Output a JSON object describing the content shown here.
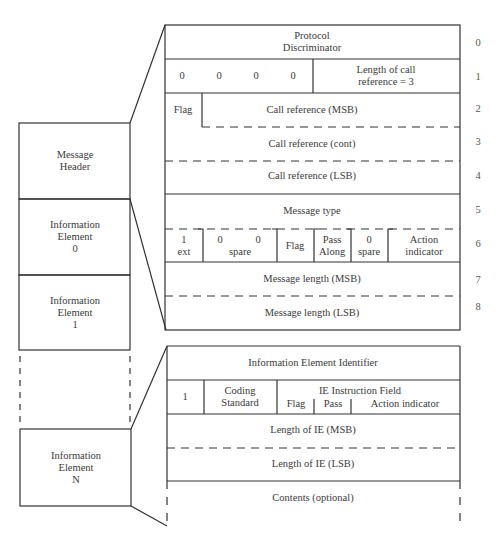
{
  "message_stack": {
    "header": "Message\nHeader",
    "ie0": "Information\nElement\n0",
    "ie1": "Information\nElement\n1",
    "ieN": "Information\nElement\nN"
  },
  "header_format": {
    "octets": [
      "0",
      "1",
      "2",
      "3",
      "4",
      "5",
      "6",
      "7",
      "8"
    ],
    "row0": "Protocol\nDiscriminator",
    "row1": {
      "bits": [
        "0",
        "0",
        "0",
        "0"
      ],
      "length": "Length of call\nreference = 3"
    },
    "row2": {
      "flag": "Flag",
      "msb": "Call reference (MSB)"
    },
    "row3": "Call reference (cont)",
    "row4": "Call reference (LSB)",
    "row5": "Message type",
    "row6": {
      "ext": "1\next",
      "spare_a": "0",
      "spare_b": "0",
      "spare_label": "spare",
      "flag": "Flag",
      "pass": "Pass\nAlong",
      "spare2": "0\nspare",
      "action": "Action\nindicator"
    },
    "row7": "Message length (MSB)",
    "row8": "Message length (LSB)"
  },
  "ie_format": {
    "identifier": "Information Element Identifier",
    "row1": {
      "ext": "1",
      "coding": "Coding\nStandard",
      "instruction": "IE Instruction Field",
      "flag": "Flag",
      "pass": "Pass",
      "action": "Action indicator"
    },
    "len_msb": "Length of IE (MSB)",
    "len_lsb": "Length of IE (LSB)",
    "contents": "Contents (optional)"
  }
}
